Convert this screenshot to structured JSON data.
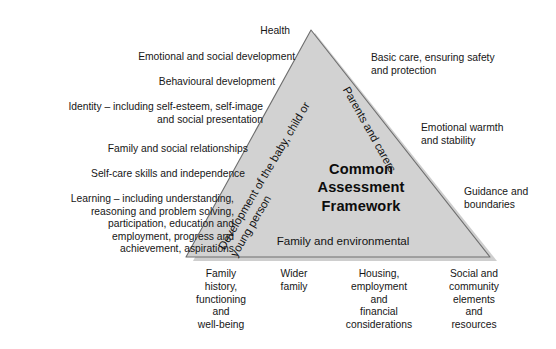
{
  "diagram": {
    "title": "Common Assessment Framework",
    "shape": "triangle",
    "fill_color": "#d2d2d2",
    "stroke_color": "#6e6e6e",
    "shadow_color": "#bdbdbd",
    "background_color": "#ffffff",
    "text_color": "#161616"
  },
  "centre": {
    "line1": "Common",
    "line2": "Assessment",
    "line3": "Framework"
  },
  "sides": {
    "left": "Development of the baby, child or\nyoung person",
    "right": "Parents and carers",
    "bottom": "Family and environmental"
  },
  "left_dimensions": [
    {
      "id": "health",
      "text": "Health"
    },
    {
      "id": "emotional-and-social-development",
      "text": "Emotional and social development"
    },
    {
      "id": "behavioural-development",
      "text": "Behavioural development"
    },
    {
      "id": "identity",
      "text": "Identity – including self-esteem, self-image\nand social presentation"
    },
    {
      "id": "family-and-social-relationships",
      "text": "Family and social relationships"
    },
    {
      "id": "self-care-skills-and-independence",
      "text": "Self-care skills and independence"
    },
    {
      "id": "learning",
      "text": "Learning – including understanding,\nreasoning and problem solving,\nparticipation, education and\nemployment, progress and\nachievement, aspirations"
    }
  ],
  "right_dimensions": [
    {
      "id": "basic-care",
      "text": "Basic care, ensuring safety\nand protection"
    },
    {
      "id": "emotional-warmth-and-stability",
      "text": "Emotional warmth\nand stability"
    },
    {
      "id": "guidance-and-boundaries",
      "text": "Guidance and\nboundaries"
    }
  ],
  "bottom_dimensions": [
    {
      "id": "family-history",
      "text": "Family\nhistory,\nfunctioning\nand\nwell-being"
    },
    {
      "id": "wider-family",
      "text": "Wider\nfamily"
    },
    {
      "id": "housing-employment-financial",
      "text": "Housing,\nemployment\nand\nfinancial\nconsiderations"
    },
    {
      "id": "social-and-community",
      "text": "Social and\ncommunity\nelements\nand\nresources"
    }
  ]
}
